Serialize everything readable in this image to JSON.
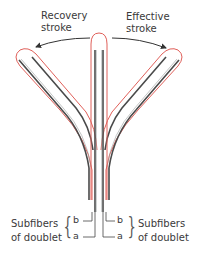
{
  "labels": {
    "recovery_line1": "Recovery",
    "recovery_line2": "stroke",
    "effective_line1": "Effective",
    "effective_line2": "stroke",
    "left_sub_line1": "Subfibers",
    "left_sub_line2": "of doublet",
    "right_sub_line1": "Subfibers",
    "right_sub_line2": "of doublet",
    "left_b": "b",
    "left_a": "a",
    "right_b": "b",
    "right_a": "a",
    "brace_left": "{",
    "brace_right": "}"
  },
  "colors": {
    "membrane": "#e0605a",
    "doublet": "#4a4a4a",
    "doublet_core": "#9aa0a0",
    "arrow": "#333333",
    "text": "#3a3a3a"
  },
  "diagram": {
    "positions": [
      "recovery",
      "upright",
      "effective"
    ]
  }
}
